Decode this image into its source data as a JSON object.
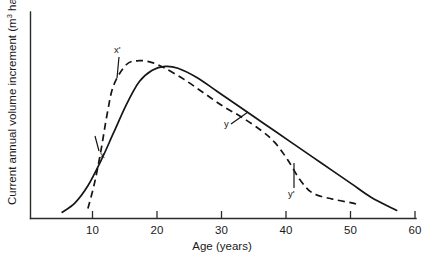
{
  "chart_data": {
    "type": "line",
    "title": "",
    "xlabel": "Age (years)",
    "ylabel_parts": {
      "base1": "Current annual volume increment (m",
      "sup1": "3",
      "base2": " ha",
      "sup2": "−1",
      "base3": ")"
    },
    "ylabel": "Current annual volume increment (m3 ha−1)",
    "xlim": [
      0,
      60
    ],
    "ylim": [
      0,
      100
    ],
    "xticks": [
      10,
      20,
      30,
      40,
      50,
      60
    ],
    "xtick_labels": [
      "10",
      "20",
      "30",
      "40",
      "50",
      "60"
    ],
    "yticks": [],
    "ytick_labels": [],
    "grid": false,
    "legend": null,
    "series": [
      {
        "name": "unthinned stand",
        "style": "solid",
        "label": "x",
        "x": [
          5,
          7,
          9,
          11,
          13,
          15,
          17,
          19,
          21,
          23,
          26,
          29,
          32,
          35,
          38,
          41,
          44,
          47,
          50,
          53,
          57
        ],
        "y": [
          3,
          8,
          17,
          30,
          45,
          60,
          72,
          78,
          80,
          79,
          74,
          67,
          60,
          53,
          46,
          39,
          32,
          25,
          18,
          11,
          4
        ]
      },
      {
        "name": "thinned stand",
        "style": "dashed",
        "label": "x'",
        "x": [
          9,
          10,
          11,
          12,
          13,
          15,
          17,
          19,
          21,
          24,
          27,
          30,
          33,
          36,
          38,
          40,
          42,
          44,
          47,
          50,
          51
        ],
        "y": [
          5,
          18,
          35,
          55,
          70,
          81,
          83,
          82,
          79,
          73,
          66,
          59,
          53,
          46,
          40,
          31,
          20,
          13,
          10,
          8,
          7
        ]
      }
    ],
    "annotations": [
      {
        "text": "x",
        "label_x": 100,
        "label_y": 158,
        "leader": {
          "x1": 95,
          "y1": 136,
          "x2": 99,
          "y2": 151
        },
        "note": "lower point on solid rising limb"
      },
      {
        "text": "x'",
        "label_x": 114,
        "label_y": 53,
        "leader": {
          "x1": 119,
          "y1": 57,
          "x2": 117,
          "y2": 78
        },
        "note": "peak region of dashed curve"
      },
      {
        "text": "y",
        "label_x": 224,
        "label_y": 127,
        "leader": {
          "x1": 231,
          "y1": 124,
          "x2": 248,
          "y2": 112
        },
        "note": "point on descending dashed limb"
      },
      {
        "text": "y'",
        "label_x": 288,
        "label_y": 197,
        "leader": {
          "x1": 294,
          "y1": 163,
          "x2": 294,
          "y2": 188
        },
        "note": "lower point on descending dashed curve"
      }
    ]
  },
  "geometry": {
    "axis_origin_x": 30,
    "axis_origin_y": 218,
    "axis_top_y": 12,
    "axis_right_x": 416
  }
}
